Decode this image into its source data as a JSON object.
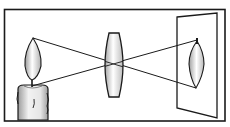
{
  "diagram": {
    "colors": {
      "stroke": "#1a1a1a",
      "background": "#ffffff",
      "flame_light": "#ffffff",
      "flame_dark": "#9a9a9a",
      "lens_light": "#ffffff",
      "lens_dark": "#a8a8a8",
      "candle_light": "#f2f2f2",
      "candle_dark": "#9c9c9c"
    },
    "elements": {
      "frame": {
        "x": 4,
        "y": 9,
        "w": 221,
        "h": 112
      },
      "candle": {
        "x": 17,
        "y": 85,
        "w": 31,
        "h": 36
      },
      "flame": {
        "tip": [
          33,
          38
        ],
        "base": [
          32,
          86
        ]
      },
      "lens": {
        "x": 107,
        "y": 33,
        "w": 14,
        "h": 64,
        "center": [
          114,
          64
        ]
      },
      "screen": {
        "tl": [
          177,
          17
        ],
        "tr": [
          217,
          13
        ],
        "br": [
          217,
          118
        ],
        "bl": [
          177,
          108
        ]
      },
      "image_flame": {
        "base": [
          197,
          40
        ],
        "tip": [
          196,
          88
        ]
      }
    }
  }
}
